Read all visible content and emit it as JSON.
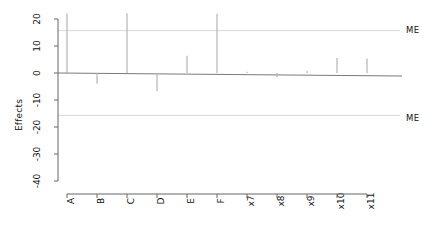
{
  "chart_data": {
    "type": "bar",
    "title": "",
    "subtitle": "",
    "xlabel": "",
    "ylabel": "Effects",
    "categories": [
      "A",
      "B",
      "C",
      "D",
      "E",
      "F",
      "x7",
      "x8",
      "x9",
      "x10",
      "x11"
    ],
    "values": [
      22.0,
      -4.0,
      22.1,
      -6.8,
      6.4,
      21.9,
      0.5,
      -1.6,
      0.7,
      5.6,
      5.4
    ],
    "series": [
      {
        "name": "Effects",
        "values": [
          22.0,
          -4.0,
          22.1,
          -6.8,
          6.4,
          21.9,
          0.5,
          -1.6,
          0.7,
          5.6,
          5.4
        ]
      }
    ],
    "ylim": [
      -42,
      22.5
    ],
    "yticks": [
      20,
      10,
      0,
      -10,
      -20,
      -30,
      -40
    ],
    "ytick_labels": [
      "20",
      "10",
      "0",
      "-10",
      "-20",
      "-30",
      "-40"
    ],
    "grid": false,
    "legend": "none",
    "annotations": [
      {
        "label": "ME",
        "type": "hline",
        "value": 15.7,
        "position": "right"
      },
      {
        "label": "ME",
        "type": "hline",
        "value": -15.7,
        "position": "right"
      }
    ],
    "bar_color": "#b4b4b4",
    "axis_color": "#666666",
    "annotation_line_color": "#d8d8d8",
    "zero_line_color": "#7a7a7a"
  }
}
